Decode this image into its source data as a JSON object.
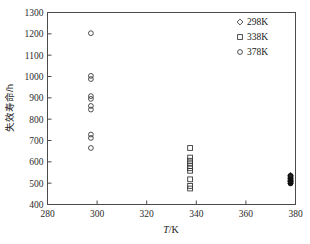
{
  "chart_data": {
    "type": "scatter",
    "title": "",
    "xlabel": "T/K",
    "xlabel_italic_part": "T",
    "xlabel_rest": "/K",
    "ylabel": "失效寿命/h",
    "xlim": [
      280,
      380
    ],
    "ylim": [
      400,
      1300
    ],
    "xticks": [
      280,
      300,
      320,
      340,
      360,
      380
    ],
    "yticks": [
      400,
      500,
      600,
      700,
      800,
      900,
      1000,
      1100,
      1200,
      1300
    ],
    "grid": false,
    "legend_position": "top-right",
    "series": [
      {
        "name": "298K",
        "marker": "diamond",
        "x": 378,
        "values": [
          537,
          528,
          521,
          515,
          508,
          500
        ]
      },
      {
        "name": "338K",
        "marker": "square",
        "x": 337.5,
        "values": [
          665,
          620,
          605,
          592,
          580,
          570,
          558,
          518,
          487,
          475
        ]
      },
      {
        "name": "378K",
        "marker": "circle",
        "x": 297.5,
        "values": [
          1203,
          1003,
          988,
          908,
          895,
          862,
          845,
          728,
          712,
          665
        ]
      }
    ],
    "dense_cluster_378K": {
      "note": "overlapping markers at x=378 near y=500-535",
      "x": 378,
      "values": [
        535,
        530,
        525,
        520,
        516,
        512,
        508,
        505,
        502,
        498
      ]
    }
  },
  "legend": {
    "entries": [
      {
        "label": "298K",
        "marker": "diamond"
      },
      {
        "label": "338K",
        "marker": "square"
      },
      {
        "label": "378K",
        "marker": "circle"
      }
    ]
  },
  "axes": {
    "x_tick_labels": [
      "280",
      "300",
      "320",
      "340",
      "360",
      "380"
    ],
    "y_tick_labels": [
      "400",
      "500",
      "600",
      "700",
      "800",
      "900",
      "1000",
      "1100",
      "1200",
      "1300"
    ],
    "x_title_italic": "T",
    "x_title_plain": "/K",
    "y_title": "失效寿命/h"
  }
}
